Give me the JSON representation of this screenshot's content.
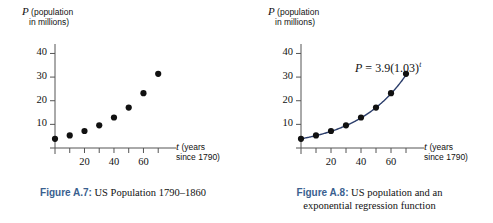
{
  "page": {
    "background": "#ffffff",
    "figure_tag_color": "#3a5f8f",
    "curve_color": "#2c3e6b",
    "point_color": "#111111",
    "axis_color": "#555555"
  },
  "figures": [
    {
      "id": "figure-a7",
      "caption_tag": "Figure A.7",
      "caption_separator": ":",
      "caption_text": " US Population 1790–1860",
      "caption_line2": "",
      "chart_data": {
        "type": "scatter",
        "title": "US Population 1790-1860",
        "xlabel": "t (years since 1790)",
        "ylabel": "P (population in millions)",
        "xlabel_var": "t",
        "xlabel_rest_line1": " (years",
        "xlabel_rest_line2": "since 1790)",
        "ylabel_var": "P",
        "ylabel_rest_line1": " (population",
        "ylabel_rest_line2": "in millions)",
        "xlim": [
          0,
          78
        ],
        "ylim": [
          0,
          44
        ],
        "xticks": [
          10,
          20,
          30,
          40,
          50,
          60,
          70
        ],
        "xtick_labels": [
          "",
          "20",
          "",
          "40",
          "",
          "60",
          ""
        ],
        "yticks": [
          10,
          20,
          30,
          40
        ],
        "ytick_labels": [
          "10",
          "20",
          "30",
          "40"
        ],
        "grid": false,
        "legend": false,
        "x": [
          0,
          10,
          20,
          30,
          40,
          50,
          60,
          70
        ],
        "values": [
          3.9,
          5.3,
          7.2,
          9.6,
          12.9,
          17.1,
          23.2,
          31.4
        ],
        "show_curve": false,
        "annotation": ""
      }
    },
    {
      "id": "figure-a8",
      "caption_tag": "Figure A.8",
      "caption_separator": ":",
      "caption_text": " US population and an",
      "caption_line2": "exponential regression function",
      "chart_data": {
        "type": "scatter",
        "title": "US population and an exponential regression function",
        "xlabel": "t (years since 1790)",
        "ylabel": "P (population in millions)",
        "xlabel_var": "t",
        "xlabel_rest_line1": " (years",
        "xlabel_rest_line2": "since 1790)",
        "ylabel_var": "P",
        "ylabel_rest_line1": " (population",
        "ylabel_rest_line2": "in millions)",
        "xlim": [
          0,
          78
        ],
        "ylim": [
          0,
          44
        ],
        "xticks": [
          10,
          20,
          30,
          40,
          50,
          60,
          70
        ],
        "xtick_labels": [
          "",
          "20",
          "",
          "40",
          "",
          "60",
          ""
        ],
        "yticks": [
          10,
          20,
          30,
          40
        ],
        "ytick_labels": [
          "10",
          "20",
          "30",
          "40"
        ],
        "grid": false,
        "legend": false,
        "x": [
          0,
          10,
          20,
          30,
          40,
          50,
          60,
          70
        ],
        "values": [
          3.9,
          5.3,
          7.2,
          9.6,
          12.9,
          17.1,
          23.2,
          31.4
        ],
        "show_curve": true,
        "curve_model": {
          "a": 3.9,
          "b": 1.03,
          "formula": "P = 3.9(1.03)^t"
        },
        "annotation": "P = 3.9(1.03)^t",
        "annotation_parts": {
          "lhs": "P",
          "eq": " = ",
          "coef": "3.9(1.03)",
          "exp": "t"
        }
      }
    }
  ]
}
